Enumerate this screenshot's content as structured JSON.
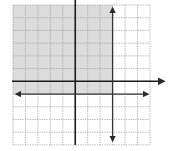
{
  "chart_data": {
    "type": "inequality-graph",
    "title": "",
    "xlabel": "",
    "ylabel": "",
    "grid": true,
    "grid_cells": {
      "cols": 11,
      "rows": 11
    },
    "xlim": [
      -5,
      6
    ],
    "ylim": [
      -5,
      6
    ],
    "lines": [
      {
        "name": "vertical-boundary",
        "equation": "x = 3",
        "style": "solid",
        "arrows": "both"
      },
      {
        "name": "horizontal-boundary",
        "equation": "y = -1",
        "style": "solid",
        "arrows": "both"
      }
    ],
    "shaded_region": {
      "description": "x <= 3 and y >= -1",
      "color": "#dcdcdc"
    },
    "axes": {
      "x_axis_arrow": "right",
      "y_axis_arrow": "none"
    }
  },
  "colors": {
    "background": "#ffffff",
    "shade": "#dcdcdc",
    "grid": "#9a9a9a",
    "axis": "#1e1e1e",
    "line": "#333333"
  },
  "layout": {
    "grid_left": 13,
    "grid_top": 5,
    "cell_w": 12.45,
    "cell_h": 12.72,
    "origin_col": 5,
    "origin_row": 6
  }
}
